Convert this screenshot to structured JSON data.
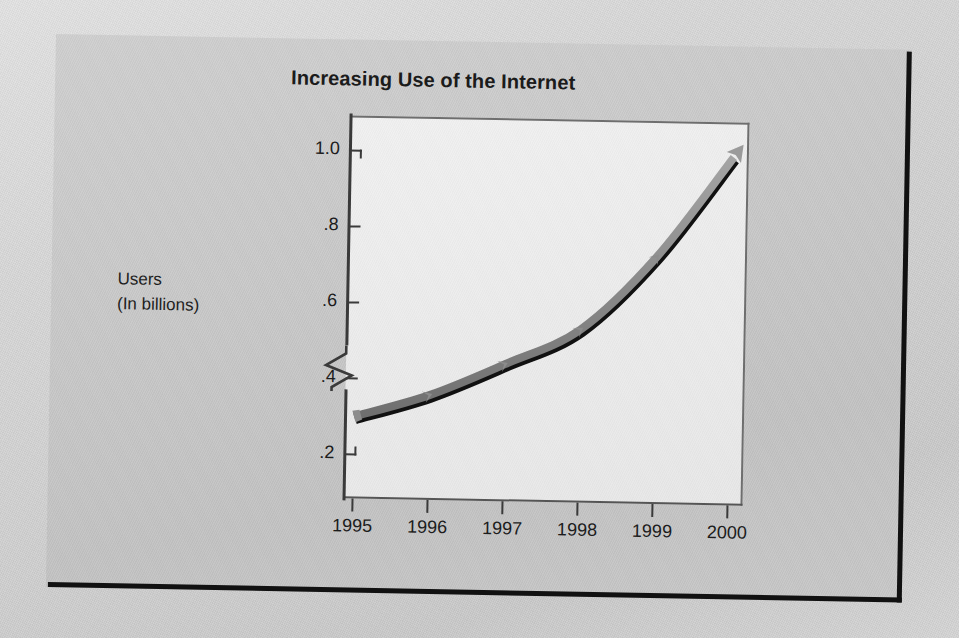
{
  "figure": {
    "title": "Increasing Use of the Internet",
    "y_axis_title_line1": "Users",
    "y_axis_title_line2": "(In billions)"
  },
  "chart_data": {
    "type": "line",
    "title": "Increasing Use of the Internet",
    "xlabel": "",
    "ylabel": "Users (In billions)",
    "categories": [
      "1995",
      "1996",
      "1997",
      "1998",
      "1999",
      "2000"
    ],
    "x": [
      1995,
      1996,
      1997,
      1998,
      1999,
      2000
    ],
    "values": [
      0.3,
      0.36,
      0.445,
      0.54,
      0.735,
      1.0
    ],
    "series": [
      {
        "name": "Internet users",
        "values": [
          0.3,
          0.36,
          0.445,
          0.54,
          0.735,
          1.0
        ]
      }
    ],
    "ylim": [
      0.2,
      1.0
    ],
    "y_ticks": [
      0.2,
      0.4,
      0.6,
      0.8,
      1.0
    ],
    "y_tick_labels": [
      ".2",
      ".4",
      ".6",
      ".8",
      "1.0"
    ],
    "x_tick_labels": [
      "1995",
      "1996",
      "1997",
      "1998",
      "1999",
      "2000"
    ],
    "y_axis_break": true,
    "grid": false,
    "legend": "none",
    "line_style": "thick gray band with black shadow, chevron markers at each point, arrowhead at final point",
    "colors": {
      "line_gray": "#8f8f8f",
      "line_shadow": "#111111",
      "plot_background": "#ebebeb",
      "panel_background": "#c7c7c7",
      "text": "#1c1c1c",
      "axis": "#3a3a3a"
    }
  }
}
